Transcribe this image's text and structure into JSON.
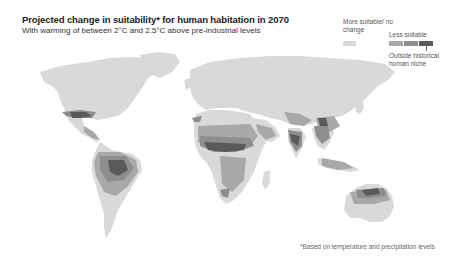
{
  "header": {
    "title": "Projected change in suitability* for human habitation in 2070",
    "subtitle": "With warming of between 2°C and 2.5°C above pre-industrial levels"
  },
  "legend": {
    "more_label": "More suitable/ no change",
    "less_label": "Less suitable",
    "outside_label": "Outside historical human niche",
    "colors": {
      "more_suitable": "#d9d9d9",
      "less_1": "#a8a8a8",
      "less_2": "#8e8e8e",
      "outside_niche": "#5a5a5a"
    }
  },
  "footnote": "*Based on temperature and precipitation levels",
  "map": {
    "type": "world choropleth",
    "regions_less_suitable": [
      "Southern United States",
      "Mexico & Central America",
      "Amazon basin / northern South America",
      "Sahel & West Africa",
      "East & southern Africa (patchy)",
      "Middle East / Arabian Peninsula",
      "India",
      "Southeast Asia",
      "Eastern China",
      "Northern Australia"
    ]
  }
}
